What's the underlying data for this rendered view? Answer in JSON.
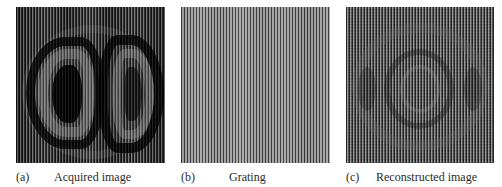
{
  "figure": {
    "panels": [
      {
        "id": "a",
        "label": "(a)",
        "caption": "Acquired image",
        "description": "Two D-shaped lobe interference fringe pattern overlaid with vertical grating stripes"
      },
      {
        "id": "b",
        "label": "(b)",
        "caption": "Grating",
        "description": "Uniform vertical line grating"
      },
      {
        "id": "c",
        "label": "(c)",
        "caption": "Reconstructed image",
        "description": "Reconstructed concentric ring pattern with residual vertical stripes"
      }
    ],
    "colors": {
      "background": "#ffffff",
      "caption_text": "#2a2a2a",
      "grating_dark": "#3a3a3a",
      "grating_light": "#a8a8a8",
      "acquired_dark": "#1a1a1a",
      "acquired_light": "#6e6e6e",
      "reconstructed_dark": "#2e2e2e",
      "reconstructed_light": "#8e8e8e"
    }
  }
}
